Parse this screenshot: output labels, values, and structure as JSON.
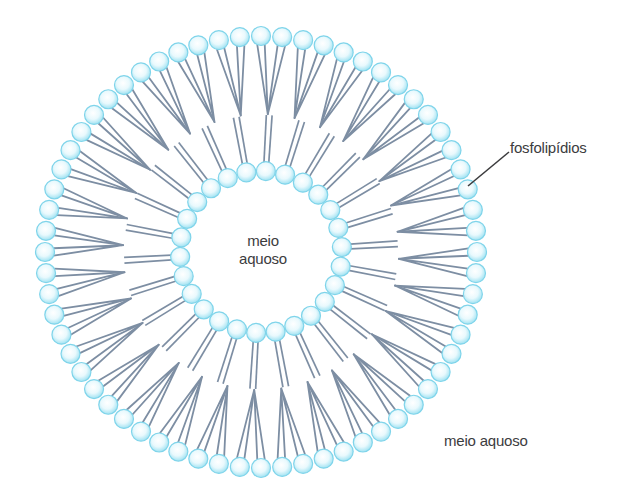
{
  "labels": {
    "phospholipids": "fosfolipídios",
    "inner_medium_line1": "meio",
    "inner_medium_line2": "aquoso",
    "outer_medium": "meio aquoso"
  },
  "structure": {
    "type": "liposome",
    "center": [
      261,
      252
    ],
    "outer_layer": {
      "head_count": 64,
      "radius": 216,
      "tail_length": 78
    },
    "inner_layer": {
      "head_count": 26,
      "radius": 81,
      "tail_length": 56
    },
    "head_radius": 9.5
  },
  "colors": {
    "head_fill_center": "#ffffff",
    "head_fill_edge": "#9fe2f2",
    "head_stroke": "#7fd4ea",
    "tail": "#7d8ea3",
    "label_text": "#3c3c3e",
    "leader_line": "#3c3c3e"
  },
  "leader_line": {
    "from": [
      468,
      186
    ],
    "to": [
      509,
      152
    ]
  }
}
